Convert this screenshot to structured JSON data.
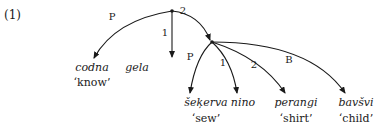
{
  "example_number": "(1)",
  "nodes": {
    "root": {
      "x": 172,
      "y": 11
    },
    "sub": {
      "x": 212,
      "y": 42
    }
  },
  "words": [
    {
      "word": "codna",
      "gloss": "‘know’",
      "x": 93,
      "y": 63
    },
    {
      "word": "gela",
      "gloss": "",
      "x": 137,
      "y": 63
    },
    {
      "word": "šeķerva",
      "gloss": "‘sew’",
      "x": 206,
      "y": 98
    },
    {
      "word": "nino",
      "gloss": "",
      "x": 243,
      "y": 98
    },
    {
      "word": "perangi",
      "gloss": "‘shirt’",
      "x": 297,
      "y": 98
    },
    {
      "word": "bavšvi",
      "gloss": "‘child’",
      "x": 357,
      "y": 98
    }
  ],
  "edges": [
    {
      "from": "root",
      "to": "codna",
      "label": "P"
    },
    {
      "from": "root",
      "to": "gela",
      "label": "1"
    },
    {
      "from": "root",
      "to": "sub",
      "label": "2"
    },
    {
      "from": "sub",
      "to": "šeķerva",
      "label": "P"
    },
    {
      "from": "sub",
      "to": "nino",
      "label": "1"
    },
    {
      "from": "sub",
      "to": "perangi",
      "label": "2"
    },
    {
      "from": "sub",
      "to": "bavšvi",
      "label": "B"
    }
  ]
}
